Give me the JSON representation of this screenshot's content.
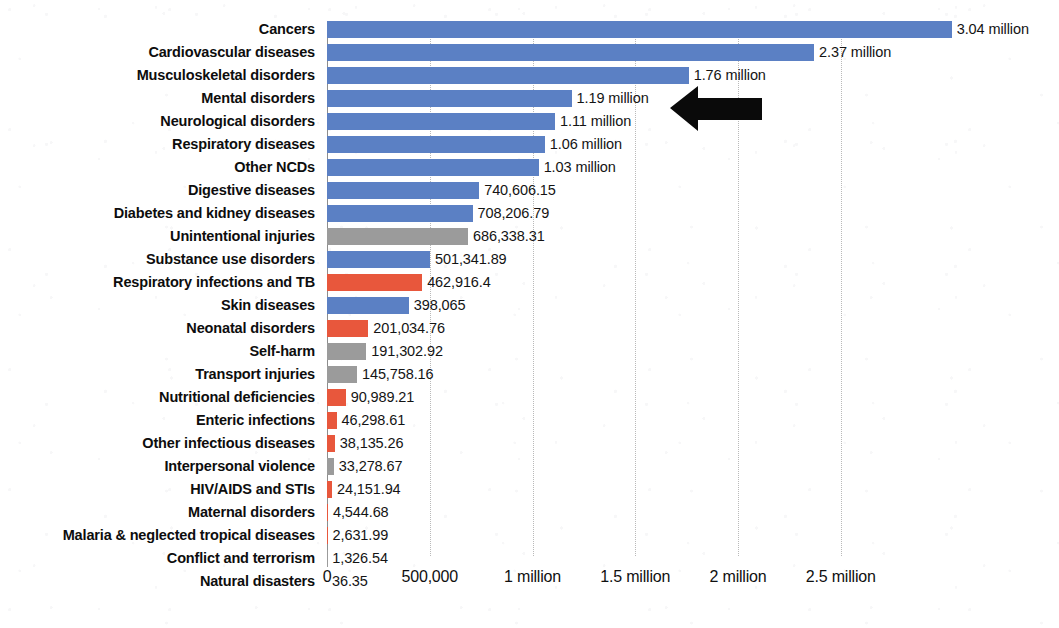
{
  "chart_data": {
    "type": "bar",
    "orientation": "horizontal",
    "title": "",
    "xlabel": "",
    "ylabel": "",
    "xlim": [
      0,
      3200000
    ],
    "grid": true,
    "legend": "none",
    "xticks": [
      {
        "value": 0,
        "label": "0"
      },
      {
        "value": 500000,
        "label": "500,000"
      },
      {
        "value": 1000000,
        "label": "1 million"
      },
      {
        "value": 1500000,
        "label": "1.5 million"
      },
      {
        "value": 2000000,
        "label": "2 million"
      },
      {
        "value": 2500000,
        "label": "2.5 million"
      }
    ],
    "colors": {
      "ncd_blue": "#5b80c4",
      "injury_gray": "#9b9b9b",
      "communicable_red": "#e8573c"
    },
    "categories": [
      "Cancers",
      "Cardiovascular diseases",
      "Musculoskeletal disorders",
      "Mental disorders",
      "Neurological disorders",
      "Respiratory diseases",
      "Other NCDs",
      "Digestive diseases",
      "Diabetes and kidney diseases",
      "Unintentional injuries",
      "Substance use disorders",
      "Respiratory infections and TB",
      "Skin diseases",
      "Neonatal disorders",
      "Self-harm",
      "Transport injuries",
      "Nutritional deficiencies",
      "Enteric infections",
      "Other infectious diseases",
      "Interpersonal violence",
      "HIV/AIDS and STIs",
      "Maternal disorders",
      "Malaria & neglected tropical diseases",
      "Conflict and terrorism",
      "Natural disasters"
    ],
    "values": [
      3040000,
      2370000,
      1760000,
      1190000,
      1110000,
      1060000,
      1030000,
      740606.15,
      708206.79,
      686338.31,
      501341.89,
      462916.4,
      398065,
      201034.76,
      191302.92,
      145758.16,
      90989.21,
      46298.61,
      38135.26,
      33278.67,
      24151.94,
      4544.68,
      2631.99,
      1326.54,
      36.35
    ],
    "value_labels": [
      "3.04 million",
      "2.37 million",
      "1.76 million",
      "1.19 million",
      "1.11 million",
      "1.06 million",
      "1.03 million",
      "740,606.15",
      "708,206.79",
      "686,338.31",
      "501,341.89",
      "462,916.4",
      "398,065",
      "201,034.76",
      "191,302.92",
      "145,758.16",
      "90,989.21",
      "46,298.61",
      "38,135.26",
      "33,278.67",
      "24,151.94",
      "4,544.68",
      "2,631.99",
      "1,326.54",
      "36.35"
    ],
    "bar_colors": [
      "blue",
      "blue",
      "blue",
      "blue",
      "blue",
      "blue",
      "blue",
      "blue",
      "blue",
      "gray",
      "blue",
      "red",
      "blue",
      "red",
      "gray",
      "gray",
      "red",
      "red",
      "red",
      "gray",
      "red",
      "red",
      "red",
      "gray",
      "gray"
    ]
  },
  "annotations": {
    "arrow": {
      "name": "left-pointing-arrow",
      "color": "#000000",
      "points_to": "Musculoskeletal disorders",
      "direction": "left"
    }
  }
}
